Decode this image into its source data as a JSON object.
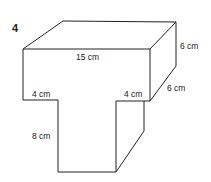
{
  "question_number": "4",
  "shape": "T-shaped prism",
  "labels": {
    "top_length": "15 cm",
    "height_top": "6 cm",
    "depth": "6 cm",
    "left_overhang": "4 cm",
    "right_overhang": "4 cm",
    "stem_height": "8 cm"
  }
}
